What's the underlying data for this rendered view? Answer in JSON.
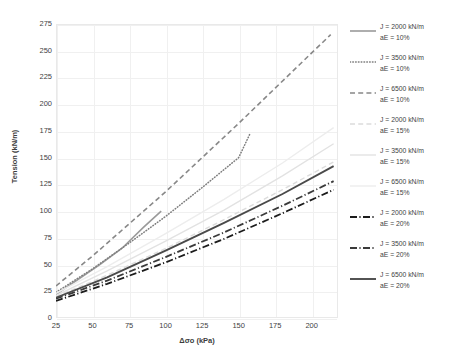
{
  "chart_data": {
    "type": "line",
    "title": "",
    "xlabel": "Δσo (kPa)",
    "ylabel": "Tension (kN/m)",
    "xlim": [
      25,
      218
    ],
    "ylim": [
      0,
      275
    ],
    "xticks": [
      25,
      50,
      75,
      100,
      125,
      150,
      175,
      200
    ],
    "yticks": [
      0,
      25,
      50,
      75,
      100,
      125,
      150,
      175,
      200,
      225,
      250,
      275
    ],
    "grid": true,
    "legend_position": "right",
    "series": [
      {
        "name": "J = 2000 kN/m aE = 10%",
        "label_line1": "J = 2000 kN/m",
        "label_line2": "aE = 10%",
        "style": "solid",
        "color": "#9a9a9a",
        "width": 1.6,
        "x": [
          25,
          40,
          55,
          70,
          85,
          97
        ],
        "y": [
          22,
          36,
          50,
          65,
          85,
          100
        ]
      },
      {
        "name": "J = 3500 kN/m aE = 10%",
        "label_line1": "J = 3500 kN/m",
        "label_line2": "aE = 10%",
        "style": "dotted",
        "color": "#7d7d7d",
        "width": 1.5,
        "x": [
          25,
          50,
          75,
          100,
          125,
          150,
          158
        ],
        "y": [
          24,
          46,
          70,
          95,
          122,
          150,
          173
        ]
      },
      {
        "name": "J = 6500 kN/m aE = 10%",
        "label_line1": "J = 6500 kN/m",
        "label_line2": "aE = 10%",
        "style": "dashed",
        "color": "#888888",
        "width": 1.6,
        "x": [
          25,
          50,
          75,
          100,
          125,
          150,
          175,
          200,
          213
        ],
        "y": [
          30,
          58,
          88,
          118,
          150,
          182,
          215,
          248,
          265
        ]
      },
      {
        "name": "J = 2000 kN/m aE = 15%",
        "label_line1": "J = 2000 kN/m",
        "label_line2": "aE = 15%",
        "style": "dashed",
        "color": "#dcdcdc",
        "width": 1.4,
        "x": [
          25,
          60,
          100,
          140,
          180,
          215
        ],
        "y": [
          20,
          40,
          65,
          92,
          120,
          146
        ]
      },
      {
        "name": "J = 3500 kN/m aE = 15%",
        "label_line1": "J = 3500 kN/m",
        "label_line2": "aE = 15%",
        "style": "solid",
        "color": "#e2e2e2",
        "width": 1.4,
        "x": [
          25,
          60,
          100,
          140,
          180,
          215
        ],
        "y": [
          21,
          44,
          72,
          101,
          133,
          163
        ]
      },
      {
        "name": "J = 6500 kN/m aE = 15%",
        "label_line1": "J = 6500 kN/m",
        "label_line2": "aE = 15%",
        "style": "solid",
        "color": "#ededed",
        "width": 1.4,
        "x": [
          25,
          60,
          100,
          140,
          180,
          215
        ],
        "y": [
          23,
          48,
          79,
          111,
          145,
          178
        ]
      },
      {
        "name": "J = 2000 kN/m aE = 20%",
        "label_line1": "J = 2000 kN/m",
        "label_line2": "aE = 20%",
        "style": "dash-dot",
        "color": "#1c1c1c",
        "width": 1.8,
        "x": [
          25,
          60,
          100,
          140,
          180,
          215
        ],
        "y": [
          16,
          32,
          52,
          74,
          98,
          120
        ]
      },
      {
        "name": "J = 3500 kN/m aE = 20%",
        "label_line1": "J = 3500 kN/m",
        "label_line2": "aE = 20%",
        "style": "dash-dot",
        "color": "#3a3a3a",
        "width": 1.8,
        "x": [
          25,
          60,
          100,
          140,
          180,
          215
        ],
        "y": [
          18,
          35,
          57,
          80,
          105,
          128
        ]
      },
      {
        "name": "J = 6500 kN/m aE = 20%",
        "label_line1": "J = 6500 kN/m",
        "label_line2": "aE = 20%",
        "style": "solid",
        "color": "#4a4a4a",
        "width": 1.9,
        "x": [
          25,
          60,
          100,
          140,
          180,
          215
        ],
        "y": [
          19,
          38,
          63,
          89,
          116,
          142
        ]
      }
    ]
  }
}
